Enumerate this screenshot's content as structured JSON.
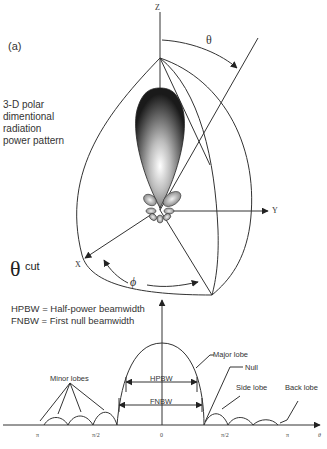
{
  "figure": {
    "panel_label": "(a)",
    "description_lines": [
      "3-D polar",
      "dimentional",
      "radiation",
      "power pattern"
    ],
    "axes": {
      "z": "Z",
      "y": "Y",
      "x": "X"
    },
    "angles": {
      "theta": "θ",
      "phi": "ϕ"
    },
    "cut_label": {
      "symbol": "θ",
      "text": "cut"
    },
    "legend": [
      "HPBW = Half-power beamwidth",
      "FNBW = First null beamwidth"
    ],
    "plot_2d": {
      "x_ticks": [
        "π",
        "π/2",
        "0",
        "π/2",
        "π"
      ],
      "x_axis_label": "θ",
      "annotations": {
        "minor_lobes": "Minor lobes",
        "major_lobe": "Major lobe",
        "null": "Null",
        "side_lobe": "Side lobe",
        "back_lobe": "Back lobe",
        "hpbw": "HPBW",
        "fnbw": "FNBW"
      }
    }
  }
}
